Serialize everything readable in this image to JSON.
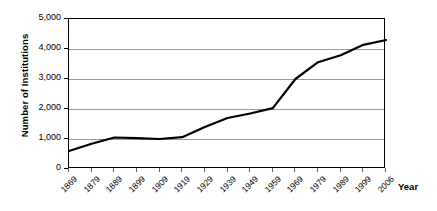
{
  "chart_data": {
    "type": "line",
    "title": "",
    "xlabel": "Year",
    "ylabel": "Number of Institutions",
    "grid": true,
    "legend": false,
    "xlim": [
      1869,
      2006
    ],
    "ylim": [
      0,
      5000
    ],
    "y_ticks": [
      0,
      1000,
      2000,
      3000,
      4000,
      5000
    ],
    "y_tick_labels": [
      "0",
      "1,000",
      "2,000",
      "3,000",
      "4,000",
      "5,000"
    ],
    "categories": [
      "1869",
      "1879",
      "1889",
      "1899",
      "1909",
      "1919",
      "1929",
      "1939",
      "1949",
      "1959",
      "1969",
      "1979",
      "1989",
      "1999",
      "2006"
    ],
    "values": [
      600,
      840,
      1050,
      1030,
      1000,
      1060,
      1400,
      1700,
      1850,
      2030,
      3000,
      3560,
      3790,
      4140,
      4300
    ],
    "series": [
      {
        "name": "Number of Institutions",
        "color": "#000000",
        "values": [
          600,
          840,
          1050,
          1030,
          1000,
          1060,
          1400,
          1700,
          1850,
          2030,
          3000,
          3560,
          3790,
          4140,
          4300
        ]
      }
    ],
    "colors": {
      "line": "#000000",
      "gridline": "#9a9a9a",
      "frame": "#000000",
      "background": "#ffffff"
    }
  }
}
